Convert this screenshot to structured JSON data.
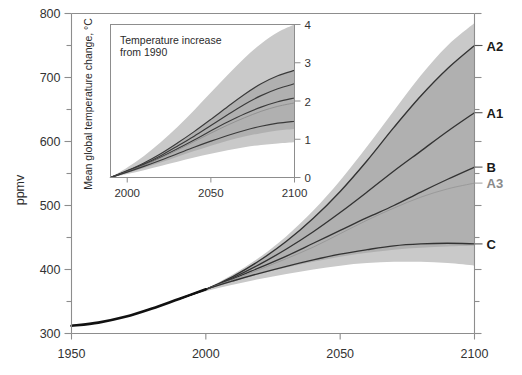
{
  "figure": {
    "background_color": "#ffffff",
    "band_outer_color": "#c9c9c9",
    "band_inner_color": "#b0b0b0",
    "curve_color": "#333333",
    "historical_color": "#111111",
    "axis_color": "#8d8d8d"
  },
  "main_axis": {
    "ylabel": "ppmv",
    "y_ticks_major": [
      300,
      400,
      500,
      600,
      700,
      800
    ],
    "y_ticks_minor": [
      350,
      450,
      550,
      650,
      750
    ],
    "ylim": [
      300,
      800
    ],
    "x_ticks": [
      1950,
      2000,
      2050,
      2100
    ],
    "xlim": [
      1950,
      2100
    ],
    "xlabel": ""
  },
  "scenario_labels": [
    {
      "name": "A2",
      "color": "#1a1a1a",
      "value_2100": 750
    },
    {
      "name": "A1",
      "color": "#1a1a1a",
      "value_2100": 645
    },
    {
      "name": "B",
      "color": "#1a1a1a",
      "value_2100": 560
    },
    {
      "name": "A3",
      "color": "#8a8a8a",
      "value_2100": 535
    },
    {
      "name": "C",
      "color": "#1a1a1a",
      "value_2100": 440
    }
  ],
  "inset": {
    "title_line1": "Temperature increase",
    "title_line2": "from 1990",
    "ylabel": "Mean global temperature change, °C",
    "y_ticks": [
      0,
      1,
      2,
      3,
      4
    ],
    "ylim": [
      0,
      4
    ],
    "x_ticks": [
      2000,
      2050,
      2100
    ],
    "xlim": [
      1990,
      2100
    ]
  },
  "chart_data": {
    "type": "line",
    "xlabel": "",
    "ylabel": "ppmv",
    "xlim": [
      1950,
      2100
    ],
    "ylim": [
      300,
      800
    ],
    "grid": false,
    "legend": "right-edge scenario labels",
    "x": [
      1950,
      1960,
      1970,
      1980,
      1990,
      2000,
      2010,
      2020,
      2030,
      2040,
      2050,
      2060,
      2070,
      2080,
      2090,
      2100
    ],
    "historical": {
      "name": "Observed CO2",
      "x": [
        1950,
        1960,
        1970,
        1980,
        1990,
        2000
      ],
      "values": [
        312,
        317,
        326,
        339,
        354,
        369
      ]
    },
    "series": [
      {
        "name": "A2",
        "values": [
          312,
          317,
          326,
          339,
          354,
          369,
          389,
          414,
          444,
          480,
          522,
          570,
          622,
          671,
          714,
          750
        ]
      },
      {
        "name": "A1",
        "values": [
          312,
          317,
          326,
          339,
          354,
          369,
          387,
          408,
          432,
          459,
          489,
          521,
          554,
          585,
          616,
          645
        ]
      },
      {
        "name": "B",
        "values": [
          312,
          317,
          326,
          339,
          354,
          369,
          385,
          403,
          421,
          441,
          461,
          481,
          500,
          521,
          541,
          560
        ]
      },
      {
        "name": "A3",
        "values": [
          312,
          317,
          326,
          339,
          354,
          369,
          384,
          400,
          417,
          435,
          456,
          477,
          496,
          513,
          526,
          535
        ]
      },
      {
        "name": "C",
        "values": [
          312,
          317,
          326,
          339,
          354,
          369,
          382,
          394,
          405,
          415,
          424,
          431,
          437,
          440,
          441,
          440
        ]
      }
    ],
    "bands": [
      {
        "name": "outer-uncertainty-range",
        "color": "#c9c9c9",
        "upper": [
          354,
          370,
          392,
          419,
          452,
          492,
          539,
          592,
          648,
          703,
          750,
          785
        ],
        "lower": [
          354,
          366,
          376,
          385,
          393,
          400,
          406,
          410,
          412,
          412,
          410,
          406
        ],
        "x": [
          1990,
          2000,
          2010,
          2020,
          2030,
          2040,
          2050,
          2060,
          2070,
          2080,
          2090,
          2100
        ]
      },
      {
        "name": "inner-uncertainty-range",
        "color": "#b0b0b0",
        "upper": [
          354,
          369,
          389,
          414,
          444,
          480,
          522,
          570,
          622,
          671,
          714,
          750
        ],
        "lower": [
          354,
          368,
          381,
          393,
          403,
          412,
          420,
          426,
          431,
          434,
          436,
          437
        ],
        "x": [
          1990,
          2000,
          2010,
          2020,
          2030,
          2040,
          2050,
          2060,
          2070,
          2080,
          2090,
          2100
        ]
      }
    ],
    "inset_chart": {
      "type": "line",
      "title": "Temperature increase from 1990",
      "xlabel": "",
      "ylabel": "Mean global temperature change, °C",
      "xlim": [
        1990,
        2100
      ],
      "ylim": [
        0,
        4
      ],
      "x": [
        1990,
        2000,
        2010,
        2020,
        2030,
        2040,
        2050,
        2060,
        2070,
        2080,
        2090,
        2100
      ],
      "series": [
        {
          "name": "A2",
          "values": [
            0.0,
            0.18,
            0.38,
            0.62,
            0.9,
            1.2,
            1.52,
            1.85,
            2.17,
            2.45,
            2.66,
            2.8
          ]
        },
        {
          "name": "A1",
          "values": [
            0.0,
            0.17,
            0.35,
            0.57,
            0.82,
            1.08,
            1.36,
            1.64,
            1.91,
            2.14,
            2.32,
            2.45
          ]
        },
        {
          "name": "B",
          "values": [
            0.0,
            0.16,
            0.33,
            0.53,
            0.75,
            0.98,
            1.22,
            1.45,
            1.66,
            1.84,
            1.98,
            2.08
          ]
        },
        {
          "name": "A3",
          "values": [
            0.0,
            0.15,
            0.32,
            0.51,
            0.72,
            0.94,
            1.16,
            1.37,
            1.56,
            1.73,
            1.86,
            1.95
          ]
        },
        {
          "name": "C",
          "values": [
            0.0,
            0.14,
            0.29,
            0.45,
            0.62,
            0.79,
            0.95,
            1.1,
            1.23,
            1.34,
            1.42,
            1.47
          ]
        }
      ],
      "bands": [
        {
          "name": "outer-uncertainty-range",
          "color": "#c9c9c9",
          "upper": [
            0.0,
            0.26,
            0.56,
            0.92,
            1.32,
            1.76,
            2.22,
            2.68,
            3.12,
            3.5,
            3.8,
            4.0
          ],
          "lower": [
            0.0,
            0.09,
            0.19,
            0.3,
            0.41,
            0.52,
            0.62,
            0.71,
            0.79,
            0.85,
            0.89,
            0.92
          ]
        },
        {
          "name": "inner-uncertainty-range",
          "color": "#b0b0b0",
          "upper": [
            0.0,
            0.18,
            0.38,
            0.62,
            0.9,
            1.2,
            1.52,
            1.85,
            2.17,
            2.45,
            2.66,
            2.8
          ],
          "lower": [
            0.0,
            0.12,
            0.25,
            0.39,
            0.54,
            0.69,
            0.83,
            0.96,
            1.07,
            1.16,
            1.23,
            1.27
          ]
        }
      ]
    }
  }
}
